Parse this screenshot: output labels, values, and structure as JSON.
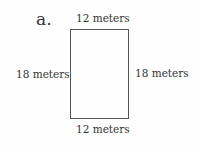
{
  "problem_label": "a.",
  "shape": "rectangle",
  "sides": {
    "top": "12 meters",
    "bottom": "12 meters",
    "left": "18 meters",
    "right": "18 meters"
  }
}
